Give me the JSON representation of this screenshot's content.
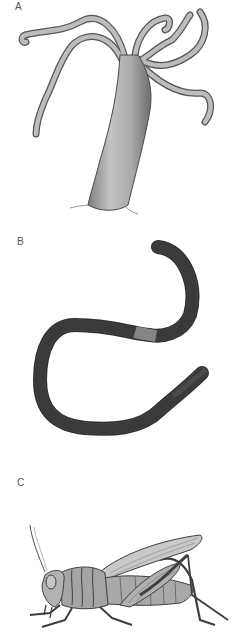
{
  "figure": {
    "panels": [
      {
        "label": "A",
        "subject": "hydra"
      },
      {
        "label": "B",
        "subject": "earthworm"
      },
      {
        "label": "C",
        "subject": "grasshopper"
      }
    ]
  },
  "colors": {
    "background": "#ffffff",
    "hydra_fill": "#b5b5b5",
    "hydra_stroke": "#4a4a4a",
    "worm_fill": "#5a5a5a",
    "worm_clitellum": "#7e7e7e",
    "insect_fill": "#a9a9a9",
    "insect_stroke": "#3e3e3e"
  }
}
